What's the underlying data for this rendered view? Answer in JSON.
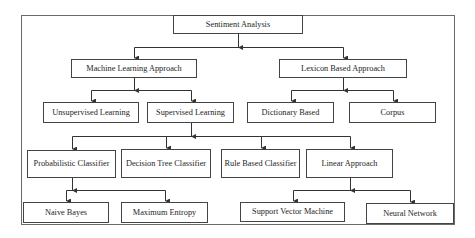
{
  "diagram": {
    "title": "Sentiment Analysis",
    "nodes": [
      {
        "id": "root",
        "label": "Sentiment Analysis",
        "x": 173,
        "y": 15,
        "w": 130,
        "h": 19
      },
      {
        "id": "ml",
        "label": "Machine Learning Approach",
        "x": 71,
        "y": 59,
        "w": 126,
        "h": 19
      },
      {
        "id": "lex",
        "label": "Lexicon Based Approach",
        "x": 279,
        "y": 59,
        "w": 128,
        "h": 19
      },
      {
        "id": "unsup",
        "label": "Unsupervised Learning",
        "x": 43,
        "y": 102,
        "w": 96,
        "h": 21
      },
      {
        "id": "sup",
        "label": "Supervised Learning",
        "x": 147,
        "y": 102,
        "w": 87,
        "h": 21
      },
      {
        "id": "dict",
        "label": "Dictionary Based",
        "x": 247,
        "y": 102,
        "w": 87,
        "h": 21
      },
      {
        "id": "corpus",
        "label": "Corpus",
        "x": 349,
        "y": 102,
        "w": 87,
        "h": 21
      },
      {
        "id": "prob",
        "label": "Probabilistic Classifier",
        "x": 27,
        "y": 150,
        "w": 89,
        "h": 28
      },
      {
        "id": "dtree",
        "label": "Decision Tree Classifier",
        "x": 121,
        "y": 149,
        "w": 90,
        "h": 29
      },
      {
        "id": "rule",
        "label": "Rule Based Classifier",
        "x": 221,
        "y": 149,
        "w": 79,
        "h": 29
      },
      {
        "id": "linear",
        "label": "Linear Approach",
        "x": 306,
        "y": 149,
        "w": 87,
        "h": 29
      },
      {
        "id": "nb",
        "label": "Naive Bayes",
        "x": 23,
        "y": 202,
        "w": 86,
        "h": 21
      },
      {
        "id": "maxent",
        "label": "Maximum Entropy",
        "x": 121,
        "y": 202,
        "w": 87,
        "h": 21
      },
      {
        "id": "svm",
        "label": "Support Vector Machine",
        "x": 240,
        "y": 202,
        "w": 105,
        "h": 20
      },
      {
        "id": "nn",
        "label": "Neural Network",
        "x": 366,
        "y": 203,
        "w": 88,
        "h": 21
      }
    ],
    "edges": [
      [
        "root",
        "ml"
      ],
      [
        "root",
        "lex"
      ],
      [
        "ml",
        "unsup"
      ],
      [
        "ml",
        "sup"
      ],
      [
        "lex",
        "dict"
      ],
      [
        "lex",
        "corpus"
      ],
      [
        "sup",
        "prob"
      ],
      [
        "sup",
        "dtree"
      ],
      [
        "sup",
        "rule"
      ],
      [
        "sup",
        "linear"
      ],
      [
        "prob",
        "nb"
      ],
      [
        "prob",
        "maxent"
      ],
      [
        "linear",
        "svm"
      ],
      [
        "linear",
        "nn"
      ]
    ],
    "colors": {
      "line": "#333333",
      "border": "#444444",
      "frame": "#6a6a6a",
      "background": "#ffffff"
    }
  }
}
